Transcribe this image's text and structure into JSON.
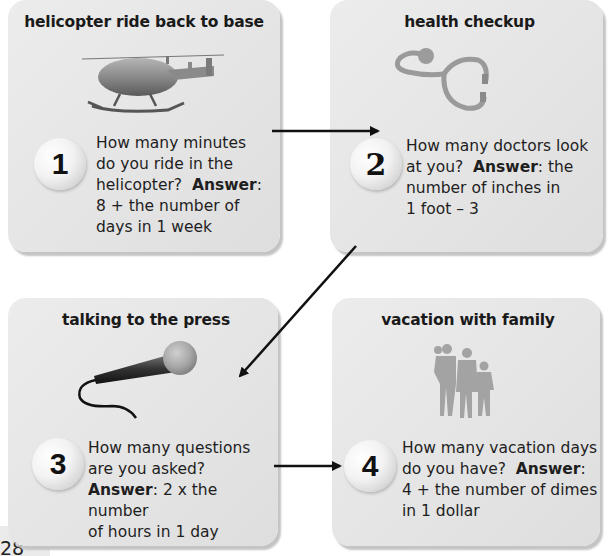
{
  "page_number": "28",
  "cards": [
    {
      "number": "1",
      "title": "helicopter ride back to base",
      "illustration": "helicopter-image",
      "question_lines": [
        "How many minutes",
        "do you ride in the",
        "helicopter?"
      ],
      "answer_label": "Answer",
      "answer_after_label": ":",
      "answer_lines": [
        "8 + the number of",
        "days in 1 week"
      ]
    },
    {
      "number": "2",
      "title": "health checkup",
      "illustration": "stethoscope-image",
      "question_lines": [
        "How many doctors look",
        "at you?"
      ],
      "answer_label": "Answer",
      "answer_after_label": ":  the",
      "answer_lines": [
        "number of inches in",
        "1 foot – 3"
      ]
    },
    {
      "number": "3",
      "title": "talking to the press",
      "illustration": "microphone-image",
      "question_lines": [
        "How many questions",
        "are you asked?"
      ],
      "answer_label": "Answer",
      "answer_after_label": ":  2 x the number",
      "answer_lines": [
        "of hours in 1 day"
      ]
    },
    {
      "number": "4",
      "title": "vacation with family",
      "illustration": "family-silhouette-image",
      "question_lines": [
        "How many vacation days",
        "do you have?"
      ],
      "answer_label": "Answer",
      "answer_after_label": ":",
      "answer_lines": [
        "4 + the number of dimes",
        "in 1 dollar"
      ]
    }
  ],
  "colors": {
    "card_bg": "#e6e6e6",
    "arrow": "#111111",
    "text": "#1e1e1e"
  }
}
